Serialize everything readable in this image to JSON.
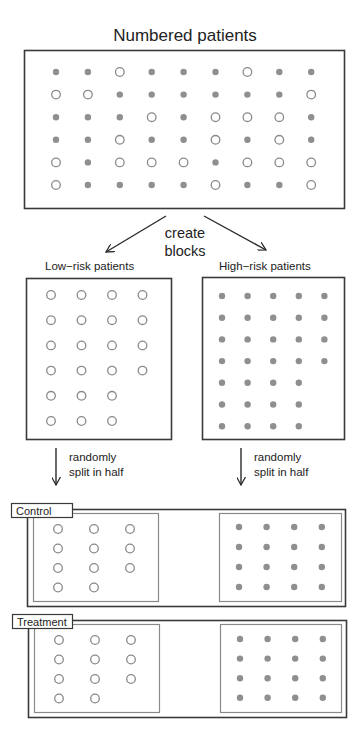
{
  "title": "Numbered patients",
  "colors": {
    "line": "#3a3a3a",
    "inner_line": "#8a8a8a",
    "open_stroke": "#8a8a8a",
    "filled": "#8f8f8f"
  },
  "legend_semantics": {
    "open_circle": "low-risk patient",
    "filled_dot": "high-risk patient"
  },
  "patients_grid": {
    "rows": 6,
    "cols": 9,
    "cells": [
      [
        "H",
        "H",
        "L",
        "H",
        "H",
        "H",
        "L",
        "H",
        "H"
      ],
      [
        "L",
        "L",
        "H",
        "H",
        "H",
        "H",
        "H",
        "H",
        "L"
      ],
      [
        "H",
        "H",
        "H",
        "L",
        "H",
        "L",
        "L",
        "L",
        "H"
      ],
      [
        "H",
        "H",
        "L",
        "H",
        "H",
        "L",
        "H",
        "L",
        "H"
      ],
      [
        "L",
        "H",
        "L",
        "L",
        "L",
        "H",
        "L",
        "L",
        "L"
      ],
      [
        "L",
        "H",
        "H",
        "H",
        "H",
        "L",
        "H",
        "H",
        "L"
      ]
    ]
  },
  "create_blocks": {
    "line1": "create",
    "line2": "blocks"
  },
  "blocks": {
    "low": {
      "label": "Low−risk patients",
      "row_counts": [
        4,
        4,
        4,
        4,
        3,
        3
      ],
      "total": 22
    },
    "high": {
      "label": "High−risk patients",
      "row_counts": [
        5,
        5,
        5,
        5,
        4,
        4,
        4
      ],
      "total": 32
    }
  },
  "split_text": {
    "line1": "randomly",
    "line2": "split in half"
  },
  "groups": [
    {
      "label": "Control",
      "low_row_counts": [
        3,
        3,
        3,
        2
      ],
      "high_row_counts": [
        4,
        4,
        4,
        4
      ]
    },
    {
      "label": "Treatment",
      "low_row_counts": [
        3,
        3,
        3,
        2
      ],
      "high_row_counts": [
        4,
        4,
        4,
        4
      ]
    }
  ]
}
